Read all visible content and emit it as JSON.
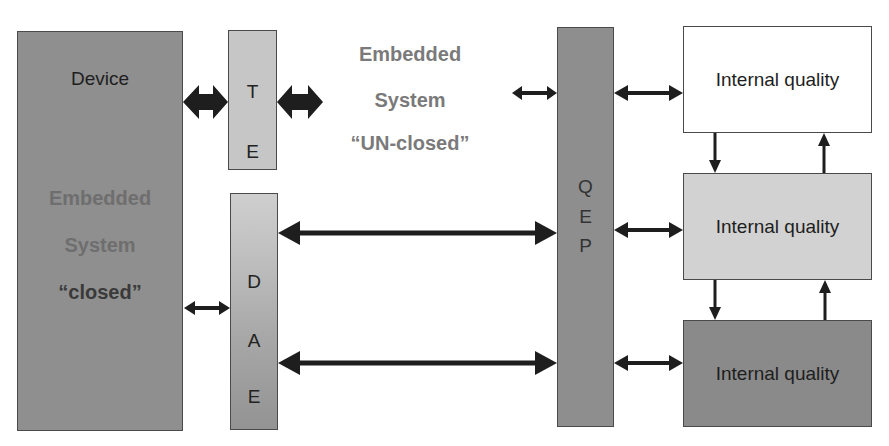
{
  "device_block": {
    "title": "Device",
    "subtitle_line1": "Embedded",
    "subtitle_line2": "System",
    "subtitle_line3": "“closed”",
    "fill": "#8f8f8f"
  },
  "te_block": {
    "letters": [
      "T",
      "E"
    ],
    "fill": "#c6c6c6"
  },
  "dae_block": {
    "letters": [
      "D",
      "A",
      "E"
    ]
  },
  "unclosed_label": {
    "line1": "Embedded",
    "line2": "System",
    "line3": "“UN-closed”",
    "color": "#7a7a7a"
  },
  "qep_block": {
    "letters": [
      "Q",
      "E",
      "P"
    ],
    "fill": "#8e8e8e"
  },
  "quality_boxes": [
    {
      "label": "Internal quality",
      "fill": "#ffffff"
    },
    {
      "label": "Internal quality",
      "fill": "#d2d2d2"
    },
    {
      "label": "Internal quality",
      "fill": "#8a8a8a"
    }
  ],
  "arrow_color": "#1e1e1e"
}
